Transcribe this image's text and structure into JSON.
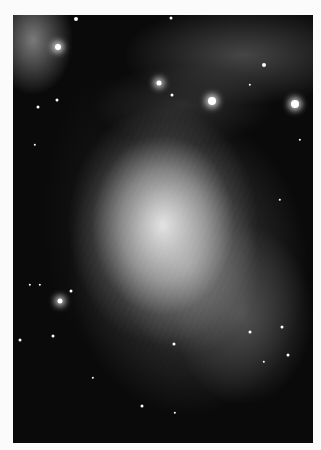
{
  "image": {
    "subject": "grayscale astronomical photograph of a diffuse nebula with surrounding star field",
    "border_color": "#fbfbfb",
    "sky_color": "#0a0a0a"
  },
  "stars": [
    {
      "x": 58,
      "y": 47,
      "r": 3,
      "bright": true
    },
    {
      "x": 76,
      "y": 19,
      "r": 2,
      "bright": false
    },
    {
      "x": 159,
      "y": 83,
      "r": 2.5,
      "bright": true
    },
    {
      "x": 212,
      "y": 101,
      "r": 4,
      "bright": true
    },
    {
      "x": 295,
      "y": 104,
      "r": 4,
      "bright": true
    },
    {
      "x": 264,
      "y": 65,
      "r": 2,
      "bright": false
    },
    {
      "x": 171,
      "y": 18,
      "r": 1.5,
      "bright": false
    },
    {
      "x": 172,
      "y": 95,
      "r": 1.5,
      "bright": false
    },
    {
      "x": 57,
      "y": 100,
      "r": 1.5,
      "bright": false
    },
    {
      "x": 38,
      "y": 107,
      "r": 1.5,
      "bright": false
    },
    {
      "x": 35,
      "y": 145,
      "r": 1.2,
      "bright": false
    },
    {
      "x": 60,
      "y": 301,
      "r": 2.5,
      "bright": true
    },
    {
      "x": 71,
      "y": 291,
      "r": 1.5,
      "bright": false
    },
    {
      "x": 20,
      "y": 340,
      "r": 1.5,
      "bright": false
    },
    {
      "x": 53,
      "y": 336,
      "r": 1.5,
      "bright": false
    },
    {
      "x": 93,
      "y": 378,
      "r": 1.2,
      "bright": false
    },
    {
      "x": 142,
      "y": 406,
      "r": 1.5,
      "bright": false
    },
    {
      "x": 174,
      "y": 344,
      "r": 1.5,
      "bright": false
    },
    {
      "x": 250,
      "y": 332,
      "r": 1.5,
      "bright": false
    },
    {
      "x": 282,
      "y": 327,
      "r": 1.5,
      "bright": false
    },
    {
      "x": 288,
      "y": 355,
      "r": 1.5,
      "bright": false
    },
    {
      "x": 264,
      "y": 362,
      "r": 1.2,
      "bright": false
    },
    {
      "x": 175,
      "y": 413,
      "r": 1.2,
      "bright": false
    },
    {
      "x": 30,
      "y": 285,
      "r": 1.2,
      "bright": false
    },
    {
      "x": 40,
      "y": 285,
      "r": 1.2,
      "bright": false
    },
    {
      "x": 300,
      "y": 140,
      "r": 1.2,
      "bright": false
    },
    {
      "x": 280,
      "y": 200,
      "r": 1.2,
      "bright": false
    },
    {
      "x": 250,
      "y": 85,
      "r": 1.2,
      "bright": false
    }
  ]
}
